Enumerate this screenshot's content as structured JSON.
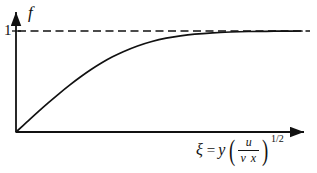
{
  "figure": {
    "background_color": "#ffffff",
    "ink_color": "#111111",
    "width": 317,
    "height": 173
  },
  "axes": {
    "y_axis_label": "f",
    "y_tick_label": "1",
    "x_axis_label": {
      "symbol": "ξ",
      "equals": "=",
      "variable": "y",
      "paren_open": "(",
      "paren_close": ")",
      "fraction_numerator": "u",
      "fraction_denominator": "ν x",
      "exponent": "1/2",
      "plain_text": "ξ = y (u / ν x)^(1/2)"
    },
    "x_origin_px": 16,
    "y_baseline_px": 132,
    "y_one_level_px": 31,
    "x_arrow_end_px": 310,
    "y_arrow_top_px": 8
  },
  "chart_data": {
    "type": "line",
    "title": "",
    "xlabel": "ξ = y (u / ν x)^(1/2)",
    "ylabel": "f",
    "xlim": [
      0,
      8
    ],
    "ylim": [
      0,
      1.12
    ],
    "grid": false,
    "legend": null,
    "y_ticks": [
      1
    ],
    "y_tick_labels": [
      "1"
    ],
    "x_ticks": [],
    "annotations": [
      {
        "kind": "asymptote",
        "style": "dashed",
        "value": 1,
        "orientation": "horizontal",
        "label": "1"
      }
    ],
    "series": [
      {
        "name": "f(ξ)",
        "style": "solid",
        "color": "#111111",
        "description": "Blasius-type boundary layer velocity profile rising monotonically from the origin and approaching the asymptote f = 1",
        "x": [
          0.0,
          0.3,
          0.6,
          0.9,
          1.2,
          1.5,
          1.8,
          2.1,
          2.4,
          2.7,
          3.0,
          3.4,
          3.8,
          4.2,
          4.6,
          5.0,
          5.5,
          6.0,
          6.5,
          7.0,
          7.5,
          8.0
        ],
        "y": [
          0.0,
          0.097,
          0.194,
          0.288,
          0.378,
          0.464,
          0.544,
          0.618,
          0.685,
          0.744,
          0.795,
          0.852,
          0.896,
          0.929,
          0.952,
          0.969,
          0.982,
          0.99,
          0.995,
          0.997,
          0.999,
          1.0
        ]
      }
    ]
  }
}
